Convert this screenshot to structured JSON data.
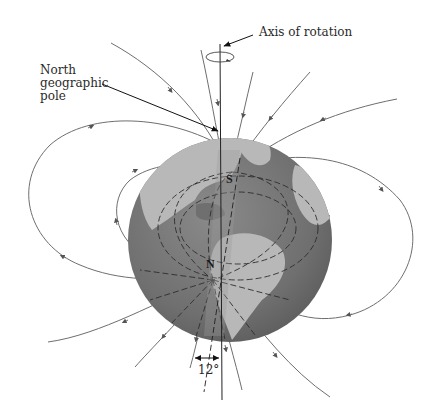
{
  "figure": {
    "labels": {
      "axis_of_rotation": "Axis of rotation",
      "north_geographic_pole_line1": "North",
      "north_geographic_pole_line2": "geographic",
      "north_geographic_pole_line3": "pole",
      "magnetic_south": "S",
      "magnetic_north": "N",
      "tilt_angle": "12°"
    },
    "colors": {
      "background": "#ffffff",
      "ocean": "#6f6f6f",
      "land": "#b8b8b8",
      "field_lines": "#6e6e6e",
      "text": "#2a2a2a"
    },
    "elements": {
      "globe": "earth-globe",
      "rotation_axis": "vertical line through north geographic pole",
      "magnetic_axis": "tilted line through S (north hemisphere) and N (south hemisphere)",
      "field_lines": "dipole field lines with arrows"
    }
  }
}
